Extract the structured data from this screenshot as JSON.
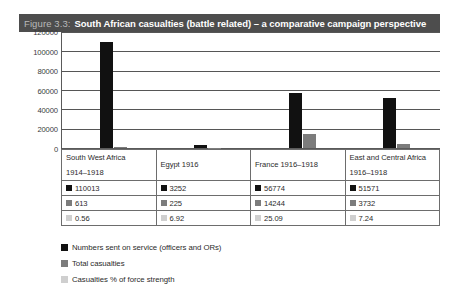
{
  "figure": {
    "number_label": "Figure 3.3:",
    "title": "South African casualties (battle related) – a comparative campaign perspective"
  },
  "chart_data": {
    "type": "bar",
    "title": "South African casualties (battle related) – a comparative campaign perspective",
    "xlabel": "",
    "ylabel": "",
    "ylim": [
      0,
      120000
    ],
    "yticks": [
      "0",
      "20000",
      "40000",
      "60000",
      "80000",
      "100000",
      "120000"
    ],
    "grid": true,
    "legend_position": "bottom",
    "categories": [
      "South West Africa 1914–1918",
      "Egypt 1916",
      "France 1916–1918",
      "East and Central Africa 1916–1918"
    ],
    "series": [
      {
        "name": "Numbers sent on service (officers and ORs)",
        "color": "#111111",
        "values": [
          110013,
          3252,
          56774,
          51571
        ]
      },
      {
        "name": "Total casualties",
        "color": "#7c7c7c",
        "values": [
          613,
          225,
          14244,
          3732
        ]
      },
      {
        "name": "Casualties % of force strength",
        "color": "#cfcfcf",
        "values": [
          0.56,
          6.92,
          25.09,
          7.24
        ]
      }
    ]
  },
  "table": {
    "headers": [
      {
        "line1": "South West Africa",
        "line2": "1914–1918"
      },
      {
        "line1": "Egypt 1916",
        "line2": ""
      },
      {
        "line1": "France 1916–1918",
        "line2": ""
      },
      {
        "line1": "East and Central Africa",
        "line2": "1916–1918"
      }
    ],
    "rows": [
      [
        "110013",
        "3252",
        "56774",
        "51571"
      ],
      [
        "613",
        "225",
        "14244",
        "3732"
      ],
      [
        "0.56",
        "6.92",
        "25.09",
        "7.24"
      ]
    ]
  },
  "legend": {
    "items": [
      {
        "label": "Numbers sent on service (officers and ORs)"
      },
      {
        "label": "Total casualties"
      },
      {
        "label": "Casualties % of force strength"
      }
    ]
  }
}
